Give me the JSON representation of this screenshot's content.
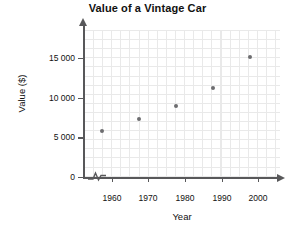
{
  "chart_data": {
    "type": "scatter",
    "title": "Value of a Vintage Car",
    "xlabel": "Year",
    "ylabel": "Value ($)",
    "x": [
      1960,
      1970,
      1980,
      1990,
      2000
    ],
    "values": [
      5200,
      6500,
      8000,
      10000,
      13500
    ],
    "xtick_labels": [
      "1960",
      "1970",
      "1980",
      "1990",
      "2000"
    ],
    "ytick_labels": [
      "0",
      "5 000",
      "10 000",
      "15 000"
    ],
    "ytick_values": [
      0,
      5000,
      10000,
      15000
    ],
    "xlim": [
      1955,
      2008
    ],
    "ylim": [
      0,
      16500
    ],
    "grid": true,
    "legend": "none",
    "axis_break": "x-axis",
    "point_color": "#6d6d70",
    "axis_color": "#58585a",
    "grid_color": "#e9e9e9"
  }
}
